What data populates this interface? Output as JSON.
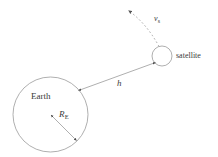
{
  "figure": {
    "name": "satellite-orbit-diagram",
    "background_color": "#ffffff",
    "stroke_color": "#8c8c8c",
    "text_color": "#3a3a3a",
    "width": 218,
    "height": 157
  },
  "labels": {
    "earth": "Earth",
    "satellite": "satellite",
    "altitude": "h",
    "radius_symbol": "R",
    "radius_subscript": "E",
    "velocity_symbol": "v",
    "velocity_subscript": "s"
  },
  "shapes": {
    "earth_circle": {
      "name": "earth-circle",
      "cx": 50.5,
      "cy": 114.5,
      "r": 37.5
    },
    "satellite_circle": {
      "name": "satellite-circle",
      "cx": 162,
      "cy": 56,
      "r": 10
    },
    "altitude_arrow": {
      "name": "altitude-double-arrow",
      "x1": 155,
      "y1": 63,
      "x2": 78,
      "y2": 91
    },
    "radius_arrow": {
      "name": "earth-radius-double-arrow",
      "x1": 50.5,
      "y1": 114.5,
      "x2": 77,
      "y2": 141
    },
    "trajectory": {
      "name": "velocity-trajectory-dashed-curve",
      "start_x": 159,
      "start_y": 46,
      "control_x": 145,
      "control_y": 22,
      "end_x": 127,
      "end_y": 9
    }
  }
}
